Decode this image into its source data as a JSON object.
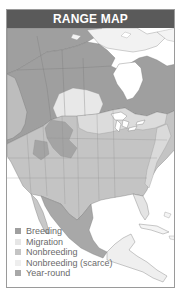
{
  "header": {
    "title": "RANGE MAP"
  },
  "colors": {
    "header_bg": "#5a5a5a",
    "breeding": "#9f9f9f",
    "migration": "#e6e6e6",
    "nonbreeding": "#c4c4c4",
    "nonbreeding_scarce": "#eeeeee",
    "year_round": "#a8a8a8",
    "land_outside": "#f4f4f4",
    "water": "#ffffff",
    "border": "#6e6e6e"
  },
  "legend": {
    "items": [
      {
        "label": "Breeding",
        "color": "#9f9f9f"
      },
      {
        "label": "Migration",
        "color": "#e6e6e6"
      },
      {
        "label": "Nonbreeding",
        "color": "#c4c4c4"
      },
      {
        "label": "Nonbreeding (scarce)",
        "color": "#eeeeee"
      },
      {
        "label": "Year-round",
        "color": "#a8a8a8"
      }
    ]
  },
  "map": {
    "region": "North America and Central America",
    "features": [
      "Alaska",
      "Canada",
      "Hudson Bay",
      "Great Lakes",
      "United States",
      "Mexico",
      "Central America",
      "Caribbean islands",
      "Greenland edge"
    ]
  }
}
